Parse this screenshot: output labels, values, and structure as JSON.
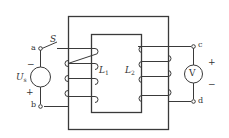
{
  "diagram": {
    "type": "transformer-circuit",
    "colors": {
      "line": "#3a3a3a",
      "background": "#ffffff"
    },
    "labels": {
      "switch": "S",
      "terminal_a": "a",
      "terminal_b": "b",
      "terminal_c": "c",
      "terminal_d": "d",
      "source_symbol": "U",
      "source_sub": "s",
      "source_minus": "−",
      "source_plus": "+",
      "coil1_symbol": "L",
      "coil1_sub": "1",
      "coil2_symbol": "L",
      "coil2_sub": "2",
      "voltmeter": "V",
      "meter_plus": "+",
      "meter_minus": "−"
    }
  }
}
